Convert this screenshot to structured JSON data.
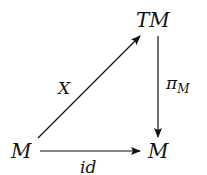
{
  "diagram": {
    "type": "commutative-diagram",
    "nodes": {
      "tm": {
        "label": "TM"
      },
      "m_left": {
        "label": "M"
      },
      "m_right": {
        "label": "M"
      }
    },
    "arrows": {
      "x": {
        "from": "M",
        "to": "TM",
        "label": "X"
      },
      "pi": {
        "from": "TM",
        "to": "M",
        "label_main": "π",
        "label_sub": "M"
      },
      "id": {
        "from": "M",
        "to": "M",
        "label": "id"
      }
    },
    "colors": {
      "ink": "#111111",
      "background": "#ffffff"
    }
  }
}
